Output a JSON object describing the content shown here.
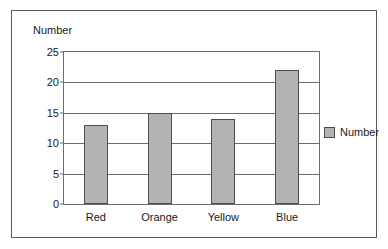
{
  "chart_data": {
    "type": "bar",
    "title": "",
    "xlabel": "",
    "ylabel": "Number",
    "categories": [
      "Red",
      "Orange",
      "Yellow",
      "Blue"
    ],
    "values": [
      13,
      15,
      14,
      22
    ],
    "series": [
      {
        "name": "Number",
        "values": [
          13,
          15,
          14,
          22
        ]
      }
    ],
    "ylim": [
      0,
      25
    ],
    "yticks": [
      0,
      5,
      10,
      15,
      20,
      25
    ],
    "ytick_labels": [
      "0",
      "5",
      "10",
      "15",
      "20",
      "25"
    ],
    "grid": true,
    "legend": {
      "position": "right",
      "entries": [
        {
          "label": "Number",
          "color": "#b3b3b3"
        }
      ]
    },
    "colors": {
      "bar_fill": "#b3b3b3",
      "bar_border": "#4d4d4d",
      "axis": "#6d6d6d",
      "text": "#1a1a1a",
      "background": "#ffffff",
      "frame_border": "#5a5a5a"
    }
  }
}
